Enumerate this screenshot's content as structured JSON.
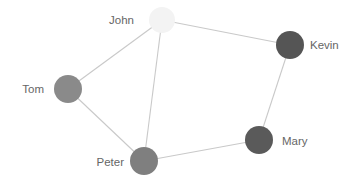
{
  "diagram": {
    "type": "network-graph",
    "nodes": [
      {
        "id": "john",
        "label": "John",
        "x": 162,
        "y": 20,
        "r": 13,
        "color": "#f3f3f3",
        "label_x": 134,
        "label_y": 24,
        "label_anchor": "end"
      },
      {
        "id": "kevin",
        "label": "Kevin",
        "x": 290,
        "y": 45,
        "r": 14,
        "color": "#555555",
        "label_x": 310,
        "label_y": 49,
        "label_anchor": "start"
      },
      {
        "id": "tom",
        "label": "Tom",
        "x": 68,
        "y": 89,
        "r": 14,
        "color": "#8a8a8a",
        "label_x": 44,
        "label_y": 93,
        "label_anchor": "end"
      },
      {
        "id": "peter",
        "label": "Peter",
        "x": 144,
        "y": 161,
        "r": 14,
        "color": "#7f7f7f",
        "label_x": 124,
        "label_y": 166,
        "label_anchor": "end"
      },
      {
        "id": "mary",
        "label": "Mary",
        "x": 259,
        "y": 140,
        "r": 14,
        "color": "#5a5a5a",
        "label_x": 282,
        "label_y": 145,
        "label_anchor": "start"
      }
    ],
    "edges": [
      {
        "from": "john",
        "to": "tom"
      },
      {
        "from": "john",
        "to": "peter"
      },
      {
        "from": "john",
        "to": "kevin"
      },
      {
        "from": "tom",
        "to": "peter"
      },
      {
        "from": "peter",
        "to": "mary"
      },
      {
        "from": "mary",
        "to": "kevin"
      }
    ],
    "edge_color": "#c9c9c9",
    "label_color": "#666666"
  }
}
